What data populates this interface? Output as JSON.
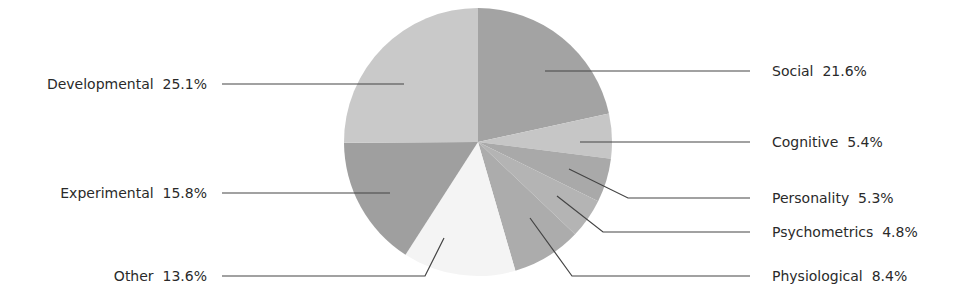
{
  "chart_data": {
    "type": "pie",
    "title": "",
    "center": [
      478,
      142
    ],
    "radius": 134,
    "start_angle_deg": 0,
    "direction": "clockwise",
    "slices": [
      {
        "name": "Social",
        "value": 21.6,
        "label": "Social  21.6%",
        "color": "#a3a3a3",
        "side": "right",
        "label_x": 772,
        "label_y": 63,
        "anchor": [
          545,
          90
        ],
        "elbow": null
      },
      {
        "name": "Cognitive",
        "value": 5.4,
        "label": "Cognitive  5.4%",
        "color": "#c6c6c6",
        "side": "right",
        "label_x": 772,
        "label_y": 134,
        "anchor": [
          580,
          135
        ],
        "elbow": null
      },
      {
        "name": "Personality",
        "value": 5.3,
        "label": "Personality  5.3%",
        "color": "#a9a9a9",
        "side": "right",
        "label_x": 772,
        "label_y": 190,
        "anchor": [
          569,
          169
        ],
        "elbow": [
          628,
          190
        ]
      },
      {
        "name": "Psychometrics",
        "value": 4.8,
        "label": "Psychometrics  4.8%",
        "color": "#b4b4b4",
        "side": "right",
        "label_x": 772,
        "label_y": 224,
        "anchor": [
          557,
          196
        ],
        "elbow": [
          603,
          224
        ]
      },
      {
        "name": "Physiological",
        "value": 8.4,
        "label": "Physiological  8.4%",
        "color": "#acacac",
        "side": "right",
        "label_x": 772,
        "label_y": 268,
        "anchor": [
          530,
          218
        ],
        "elbow": [
          572,
          268
        ]
      },
      {
        "name": "Other",
        "value": 13.6,
        "label": "Other  13.6%",
        "color": "#f4f4f4",
        "side": "left",
        "label_x": 207,
        "label_y": 268,
        "anchor": [
          444,
          238
        ],
        "elbow": [
          425,
          268
        ]
      },
      {
        "name": "Experimental",
        "value": 15.8,
        "label": "Experimental  15.8%",
        "color": "#9f9f9f",
        "side": "left",
        "label_x": 207,
        "label_y": 185,
        "anchor": [
          390,
          181
        ],
        "elbow": null
      },
      {
        "name": "Developmental",
        "value": 25.1,
        "label": "Developmental  25.1%",
        "color": "#c9c9c9",
        "side": "left",
        "label_x": 207,
        "label_y": 76,
        "anchor": [
          404,
          77
        ],
        "elbow": null
      }
    ],
    "leader_line_color": "#444444",
    "label_color": "#2a2a2a"
  }
}
